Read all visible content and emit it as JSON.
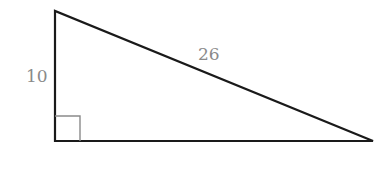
{
  "diagram": {
    "type": "right-triangle",
    "labels": {
      "vertical_leg": "10",
      "hypotenuse": "26"
    },
    "right_angle_marker": true,
    "colors": {
      "edges": "#1a1a1a",
      "labels": "#8a8a8a",
      "right_angle_marker": "#8a8a8a"
    }
  }
}
